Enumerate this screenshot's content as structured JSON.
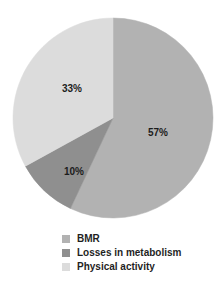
{
  "chart_data": {
    "type": "pie",
    "title": "",
    "subtitle": "",
    "xlabel": "",
    "ylabel": "",
    "grid": false,
    "legend_position": "bottom",
    "start_angle_deg": 0,
    "direction": "clockwise",
    "categories": [
      "BMR",
      "Losses in metabolism",
      "Physical activity"
    ],
    "values": [
      57,
      10,
      33
    ],
    "value_unit": "%",
    "data_labels": [
      "57%",
      "10%",
      "33%"
    ],
    "colors": [
      "#b2b2b2",
      "#8f8f8f",
      "#dcdcdc"
    ],
    "slices": [
      {
        "label": "BMR",
        "value": 57,
        "data_label": "57%",
        "color": "#b2b2b2",
        "start_deg": 0,
        "end_deg": 205.2
      },
      {
        "label": "Losses in metabolism",
        "value": 10,
        "data_label": "10%",
        "color": "#8f8f8f",
        "start_deg": 205.2,
        "end_deg": 241.2
      },
      {
        "label": "Physical activity",
        "value": 33,
        "data_label": "33%",
        "color": "#dcdcdc",
        "start_deg": 241.2,
        "end_deg": 360
      }
    ]
  },
  "pie": {
    "center_x": 113,
    "center_y": 118,
    "radius": 100,
    "labels": [
      {
        "text": "57%",
        "x": 158,
        "y": 133
      },
      {
        "text": "10%",
        "x": 74,
        "y": 172
      },
      {
        "text": "33%",
        "x": 72,
        "y": 89
      }
    ]
  },
  "legend": {
    "items": [
      {
        "label": "BMR",
        "color": "#b2b2b2"
      },
      {
        "label": "Losses in metabolism",
        "color": "#8f8f8f"
      },
      {
        "label": "Physical activity",
        "color": "#dcdcdc"
      }
    ]
  }
}
